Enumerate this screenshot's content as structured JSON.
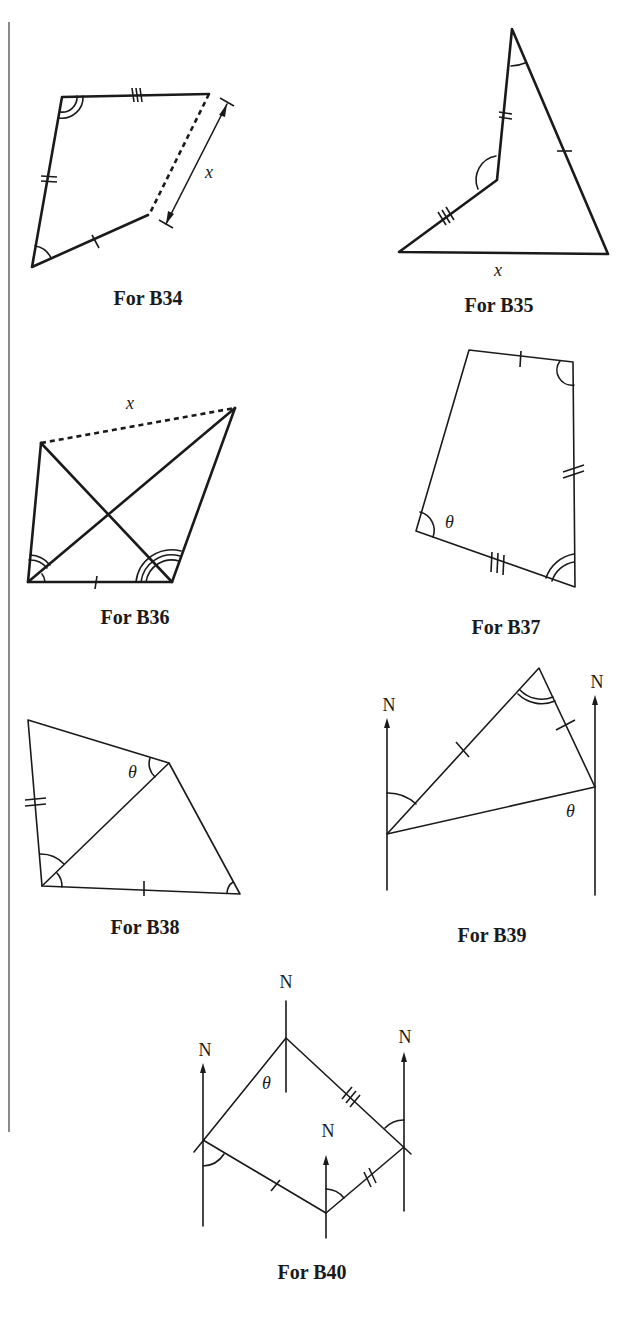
{
  "figures": [
    {
      "id": "B34",
      "caption": "For B34",
      "labels": {
        "side": "x"
      }
    },
    {
      "id": "B35",
      "caption": "For B35",
      "labels": {
        "side": "x"
      }
    },
    {
      "id": "B36",
      "caption": "For B36",
      "labels": {
        "side": "x"
      }
    },
    {
      "id": "B37",
      "caption": "For B37",
      "labels": {
        "angle": "θ"
      }
    },
    {
      "id": "B38",
      "caption": "For B38",
      "labels": {
        "angle": "θ"
      }
    },
    {
      "id": "B39",
      "caption": "For B39",
      "labels": {
        "north_left": "N",
        "north_right": "N",
        "angle": "θ"
      }
    },
    {
      "id": "B40",
      "caption": "For B40",
      "labels": {
        "north_top": "N",
        "north_left": "N",
        "north_right": "N",
        "north_bottom": "N",
        "angle": "θ"
      }
    }
  ]
}
